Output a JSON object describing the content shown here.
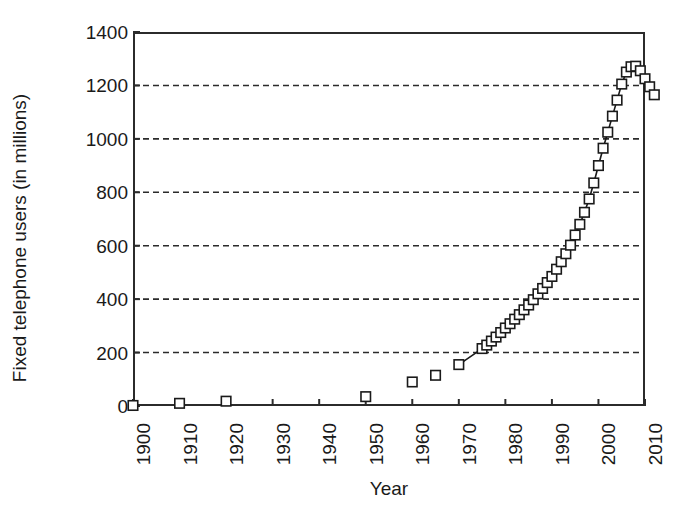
{
  "chart_data": {
    "type": "scatter",
    "title": "",
    "xlabel": "Year",
    "ylabel": "Fixed telephone users (in millions)",
    "xlim": [
      1900,
      2010
    ],
    "ylim": [
      0,
      1400
    ],
    "xticks": [
      1900,
      1910,
      1920,
      1930,
      1940,
      1950,
      1960,
      1970,
      1980,
      1990,
      2000,
      2010
    ],
    "xtick_labels": [
      "1900",
      "1910",
      "1920",
      "1930",
      "1940",
      "1950",
      "1960",
      "1970",
      "1980",
      "1990",
      "2000",
      "2010"
    ],
    "yticks": [
      0,
      200,
      400,
      600,
      800,
      1000,
      1200,
      1400
    ],
    "ytick_labels": [
      "0",
      "200",
      "400",
      "600",
      "800",
      "1000",
      "1200",
      "1400"
    ],
    "gridlines_y": [
      200,
      400,
      600,
      800,
      1000,
      1200
    ],
    "grid": "horizontal-dashed",
    "legend": "none",
    "marker": "open-square",
    "marker_color": "#1a1a1a",
    "marker_fill": "#ffffff",
    "line_color": "#1a1a1a",
    "series": [
      {
        "name": "Fixed telephone users",
        "x": [
          1900,
          1910,
          1920,
          1950,
          1960,
          1965,
          1970,
          1975,
          1976,
          1977,
          1978,
          1979,
          1980,
          1981,
          1982,
          1983,
          1984,
          1985,
          1986,
          1987,
          1988,
          1989,
          1990,
          1991,
          1992,
          1993,
          1994,
          1995,
          1996,
          1997,
          1998,
          1999,
          2000,
          2001,
          2002,
          2003,
          2004,
          2005,
          2006,
          2007,
          2008,
          2009,
          2010,
          2011,
          2012
        ],
        "y": [
          2,
          10,
          18,
          35,
          90,
          115,
          155,
          215,
          228,
          243,
          258,
          275,
          292,
          308,
          325,
          342,
          360,
          378,
          398,
          420,
          440,
          462,
          485,
          512,
          540,
          570,
          602,
          640,
          680,
          725,
          775,
          835,
          900,
          965,
          1025,
          1085,
          1145,
          1205,
          1250,
          1270,
          1272,
          1255,
          1225,
          1195,
          1165
        ]
      }
    ]
  }
}
